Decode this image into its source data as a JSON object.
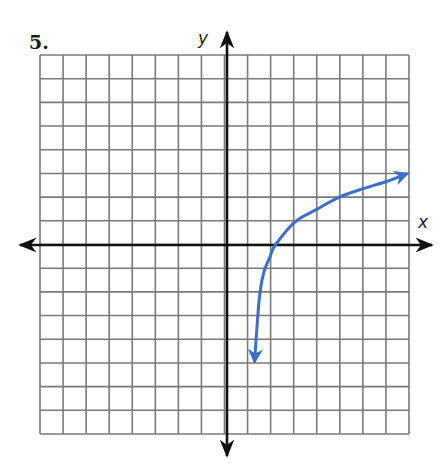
{
  "problem": {
    "number": "5."
  },
  "chart_data": {
    "type": "line",
    "title": "",
    "xlabel": "x",
    "ylabel": "y",
    "xlim": [
      -8,
      8
    ],
    "ylim": [
      -8,
      8
    ],
    "grid": true,
    "grid_cells": {
      "columns": 16,
      "rows": 16
    },
    "axes_arrows": true,
    "series": [
      {
        "name": "curve",
        "color": "#3b6fc9",
        "arrow_both_ends": true,
        "approx_function": "y = log2(x - 1)",
        "points": [
          {
            "x": 1.2,
            "y": -4.9
          },
          {
            "x": 1.33,
            "y": -3.1
          },
          {
            "x": 1.4,
            "y": -2.3
          },
          {
            "x": 1.5,
            "y": -1.6
          },
          {
            "x": 1.65,
            "y": -1.0
          },
          {
            "x": 1.87,
            "y": -0.5
          },
          {
            "x": 2.1,
            "y": 0
          },
          {
            "x": 2.96,
            "y": 0.98
          },
          {
            "x": 3.9,
            "y": 1.5
          },
          {
            "x": 4.84,
            "y": 2.0
          },
          {
            "x": 5.93,
            "y": 2.38
          },
          {
            "x": 6.87,
            "y": 2.66
          },
          {
            "x": 7.8,
            "y": 3.0
          }
        ]
      }
    ]
  },
  "colors": {
    "grid": "#7a7a7a",
    "axis": "#111111",
    "curve": "#3b6fc9"
  }
}
